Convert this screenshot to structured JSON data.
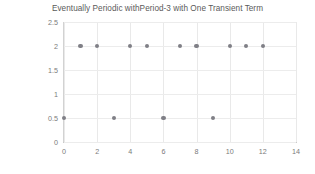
{
  "chart_data": {
    "type": "scatter",
    "title": "Eventually Periodic withPeriod-3 with One Transient Term",
    "xlabel": "",
    "ylabel": "",
    "xlim": [
      0,
      14
    ],
    "ylim": [
      0,
      2.5
    ],
    "grid": true,
    "legend": "none",
    "marker_color": "#7f7f86",
    "x": [
      0,
      1,
      2,
      3,
      4,
      5,
      6,
      7,
      8,
      9,
      10,
      11,
      12
    ],
    "y": [
      0.5,
      2,
      2,
      0.5,
      2,
      2,
      0.5,
      2,
      2,
      0.5,
      2,
      2,
      2
    ],
    "xticks": [
      0,
      2,
      4,
      6,
      8,
      10,
      12,
      14
    ],
    "xtick_labels": [
      "0",
      "2",
      "4",
      "6",
      "8",
      "10",
      "12",
      "14"
    ],
    "yticks": [
      0,
      0.5,
      1,
      1.5,
      2,
      2.5
    ],
    "ytick_labels": [
      "0",
      "0.5",
      "1",
      "1.5",
      "2",
      "2.5"
    ]
  }
}
